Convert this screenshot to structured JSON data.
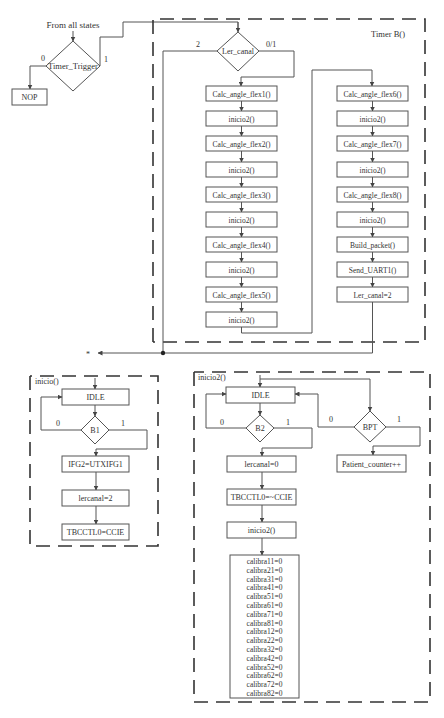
{
  "diagram": {
    "entry_label": "From all states",
    "timer_trigger": {
      "label": "Timer_Trigger",
      "branch_0": "0",
      "branch_1": "1"
    },
    "nop": "NOP",
    "timer_b": {
      "title": "Timer B()",
      "ler_canal": {
        "label": "Ler_canal",
        "branch_2": "2",
        "branch_01": "0/1"
      },
      "left_column": [
        "Calc_angle_flex1()",
        "inicio2()",
        "Calc_angle_flex2()",
        "inicio2()",
        "Calc_angle_flex3()",
        "inicio2()",
        "Calc_angle_flex4()",
        "inicio2()",
        "Calc_angle_flex5()",
        "inicio2()"
      ],
      "right_column": [
        "Calc_angle_flex6()",
        "inicio2()",
        "Calc_angle_flex7()",
        "inicio2()",
        "Calc_angle_flex8()",
        "inicio2()",
        "Build_packet()",
        "Send_UART1()",
        "Ler_canal=2"
      ]
    },
    "return_marker": "*",
    "inicio": {
      "title": "inicio()",
      "idle": "IDLE",
      "b1": {
        "label": "B1",
        "branch_0": "0",
        "branch_1": "1"
      },
      "steps": [
        "IFG2=UTXIFG1",
        "lercanal=2",
        "TBCCTL0=CCIE"
      ]
    },
    "inicio2": {
      "title": "inicio2()",
      "idle": "IDLE",
      "b2": {
        "label": "B2",
        "branch_0": "0",
        "branch_1": "1"
      },
      "bpt": {
        "label": "BPT",
        "branch_0": "0",
        "branch_1": "1"
      },
      "patient_counter": "Patient_counter++",
      "steps": [
        "lercanal=0",
        "TBCCTL0=~CCIE",
        "inicio2()"
      ],
      "calibra": [
        "calibra11=0",
        "calibra21=0",
        "calibra31=0",
        "calibra41=0",
        "calibra51=0",
        "calibra61=0",
        "calibra71=0",
        "calibra81=0",
        "calibra12=0",
        "calibra22=0",
        "calibra32=0",
        "calibra42=0",
        "calibra52=0",
        "calibra62=0",
        "calibra72=0",
        "calibra82=0"
      ]
    }
  }
}
